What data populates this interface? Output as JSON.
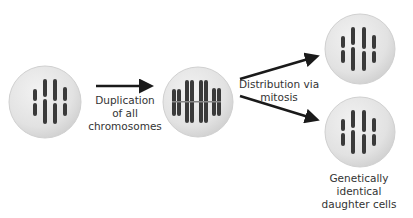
{
  "diagram": {
    "colors": {
      "cell_fill": "#e6e6e6",
      "cell_edge": "#c8c8c8",
      "chromosome": "#3a3a3a",
      "arrow": "#1a1a1a",
      "text": "#333333"
    },
    "cells": [
      {
        "id": "parent-cell",
        "state": "unduplicated"
      },
      {
        "id": "duplicated-cell",
        "state": "duplicated"
      },
      {
        "id": "daughter-cell-top",
        "state": "unduplicated"
      },
      {
        "id": "daughter-cell-bottom",
        "state": "unduplicated"
      }
    ],
    "labels": {
      "duplication": [
        "Duplication",
        "of all",
        "chromosomes"
      ],
      "distribution": [
        "Distribution via",
        "mitosis"
      ],
      "daughters": [
        "Genetically",
        "identical",
        "daughter cells"
      ]
    }
  }
}
